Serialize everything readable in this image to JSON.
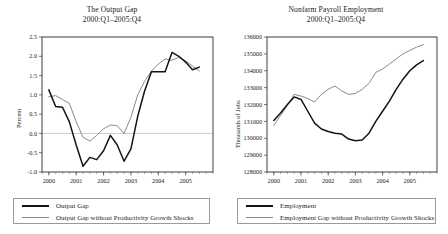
{
  "chart_data": [
    {
      "id": "output-gap",
      "type": "line",
      "title": "The Output Gap",
      "subtitle": "2000:Q1–2005:Q4",
      "xlabel": "",
      "ylabel": "Percent",
      "ylim": [
        -1.0,
        2.5
      ],
      "yticks": [
        "2.5",
        "2.0",
        "1.5",
        "1.0",
        "0.5",
        "0.0",
        "-0.5",
        "-1.0"
      ],
      "ytick_values": [
        2.5,
        2.0,
        1.5,
        1.0,
        0.5,
        0.0,
        -0.5,
        -1.0
      ],
      "xlim": [
        1999.75,
        2006.0
      ],
      "xticks": [
        "2000",
        "2001",
        "2002",
        "2003",
        "2004",
        "2005"
      ],
      "xtick_values": [
        2000,
        2001,
        2002,
        2003,
        2004,
        2005
      ],
      "grid": false,
      "zero_line": true,
      "legend_position": "below",
      "x": [
        2000.0,
        2000.25,
        2000.5,
        2000.75,
        2001.0,
        2001.25,
        2001.5,
        2001.75,
        2002.0,
        2002.25,
        2002.5,
        2002.75,
        2003.0,
        2003.25,
        2003.5,
        2003.75,
        2004.0,
        2004.25,
        2004.5,
        2004.75,
        2005.0,
        2005.25,
        2005.5
      ],
      "series": [
        {
          "name": "Output Gap",
          "color": "#141414",
          "values": [
            1.13,
            0.7,
            0.68,
            0.3,
            -0.3,
            -0.85,
            -0.62,
            -0.68,
            -0.45,
            -0.05,
            -0.3,
            -0.72,
            -0.4,
            0.45,
            1.1,
            1.6,
            1.6,
            1.6,
            2.1,
            2.0,
            1.85,
            1.65,
            1.72
          ]
        },
        {
          "name": "Output Gap without Productivity Growth Shocks",
          "color": "#8a8a8a",
          "values": [
            0.95,
            0.98,
            0.88,
            0.78,
            0.3,
            -0.1,
            -0.2,
            -0.05,
            0.12,
            0.22,
            0.2,
            0.0,
            0.42,
            1.0,
            1.35,
            1.62,
            1.8,
            1.93,
            1.9,
            1.97,
            1.88,
            1.75,
            1.62
          ]
        }
      ],
      "legend": [
        {
          "label": "Output Gap",
          "color": "#141414",
          "style": "thick-black"
        },
        {
          "label": "Output Gap without Productivity Growth Shocks",
          "color": "#8a8a8a",
          "style": "thin-gray"
        }
      ]
    },
    {
      "id": "nonfarm-payroll-employment",
      "type": "line",
      "title": "Nonfarm Payroll Employment",
      "subtitle": "2000:Q1–2005:Q4",
      "xlabel": "",
      "ylabel": "Thousands of Jobs",
      "ylim": [
        128000,
        136000
      ],
      "yticks": [
        "136000",
        "135000",
        "134000",
        "133000",
        "132000",
        "131000",
        "130000",
        "129000",
        "128000"
      ],
      "ytick_values": [
        136000,
        135000,
        134000,
        133000,
        132000,
        131000,
        130000,
        129000,
        128000
      ],
      "xlim": [
        1999.75,
        2006.0
      ],
      "xticks": [
        "2000",
        "2001",
        "2002",
        "2003",
        "2004",
        "2005"
      ],
      "xtick_values": [
        2000,
        2001,
        2002,
        2003,
        2004,
        2005
      ],
      "grid": false,
      "zero_line": false,
      "legend_position": "below",
      "x": [
        2000.0,
        2000.25,
        2000.5,
        2000.75,
        2001.0,
        2001.25,
        2001.5,
        2001.75,
        2002.0,
        2002.25,
        2002.5,
        2002.75,
        2003.0,
        2003.25,
        2003.5,
        2003.75,
        2004.0,
        2004.25,
        2004.5,
        2004.75,
        2005.0,
        2005.25,
        2005.5
      ],
      "series": [
        {
          "name": "Employment",
          "color": "#141414",
          "values": [
            131050,
            131500,
            132000,
            132450,
            132300,
            131600,
            130900,
            130550,
            130400,
            130300,
            130250,
            129950,
            129850,
            129900,
            130300,
            131000,
            131600,
            132200,
            132900,
            133500,
            134000,
            134350,
            134600
          ]
        },
        {
          "name": "Employment Gap without Productivity Growth Shocks",
          "color": "#8a8a8a",
          "values": [
            130750,
            131350,
            131950,
            132600,
            132500,
            132350,
            132150,
            132600,
            132900,
            133100,
            132800,
            132600,
            132650,
            132900,
            133250,
            133900,
            134100,
            134400,
            134700,
            135000,
            135200,
            135400,
            135550
          ]
        }
      ],
      "legend": [
        {
          "label": "Employment",
          "color": "#141414",
          "style": "thick-black"
        },
        {
          "label": "Employment Gap without Productivity Growth Shocks",
          "color": "#8a8a8a",
          "style": "thin-gray"
        }
      ]
    }
  ]
}
